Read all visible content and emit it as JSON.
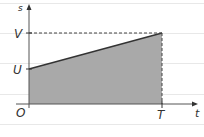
{
  "diagram": {
    "type": "speed-time graph (trapezoid area)",
    "axes": {
      "y_label": "s",
      "x_label": "t",
      "origin_label": "O"
    },
    "labels": {
      "initial_value": "U",
      "final_value": "V",
      "end_time": "T"
    },
    "points": [
      {
        "t": 0,
        "s": "U"
      },
      {
        "t": "T",
        "s": "V"
      }
    ],
    "shaded_region": "area under line from t=0 to t=T",
    "colors": {
      "fill": "#a9a9a9",
      "line": "#333333",
      "guide_lines": "#e6e6e6",
      "dashed": "#444444"
    }
  }
}
